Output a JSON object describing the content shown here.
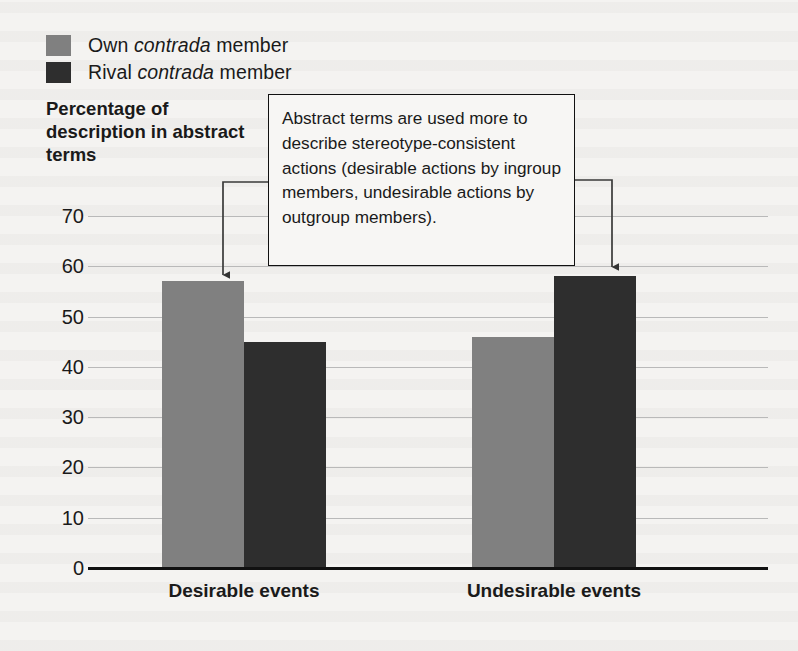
{
  "legend": {
    "items": [
      {
        "label_prefix": "Own",
        "label_italic": "contrada",
        "label_suffix": "member",
        "color": "#808080",
        "name": "own-contrada-member"
      },
      {
        "label_prefix": "Rival",
        "label_italic": "contrada",
        "label_suffix": "member",
        "color": "#2e2e2e",
        "name": "rival-contrada-member"
      }
    ]
  },
  "annotation": {
    "text": "Abstract terms are used more to describe stereotype-consistent actions (desirable actions by ingroup members, undesirable actions by outgroup members)."
  },
  "chart_data": {
    "type": "bar",
    "title": "",
    "ylabel": "Percentage of description in abstract terms",
    "xlabel": "",
    "categories": [
      "Desirable events",
      "Undesirable events"
    ],
    "series": [
      {
        "name": "Own contrada member",
        "color": "#808080",
        "values": [
          57,
          46
        ]
      },
      {
        "name": "Rival contrada member",
        "color": "#2e2e2e",
        "values": [
          45,
          58
        ]
      }
    ],
    "ylim": [
      0,
      70
    ],
    "yticks": [
      0,
      10,
      20,
      30,
      40,
      50,
      60,
      70
    ],
    "ytick_labels": [
      "0",
      "10",
      "20",
      "30",
      "40",
      "50",
      "60",
      "70"
    ],
    "grid": true,
    "legend_position": "top-left",
    "annotations": [
      {
        "text": "Abstract terms are used more to describe stereotype-consistent actions (desirable actions by ingroup members, undesirable actions by outgroup members).",
        "points_to": [
          "Desirable events / Own contrada member",
          "Undesirable events / Rival contrada member"
        ]
      }
    ]
  }
}
